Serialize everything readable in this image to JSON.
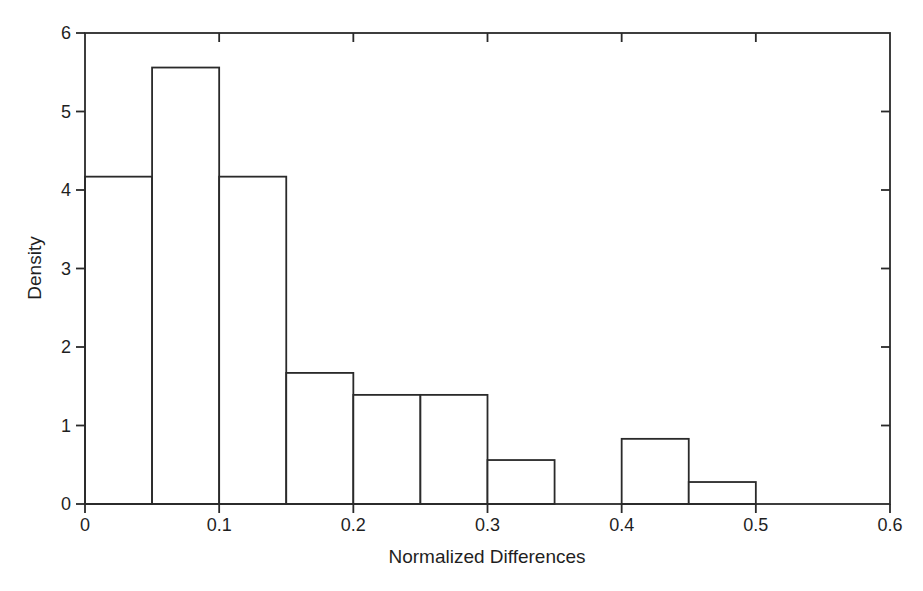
{
  "figure": {
    "background": "#ffffff",
    "line_color": "#2a2a2a",
    "text_color": "#1f1f1f",
    "bar_fill": "#ffffff"
  },
  "chart_data": {
    "type": "bar",
    "subtype": "histogram",
    "title": "",
    "xlabel": "Normalized Differences",
    "ylabel": "Density",
    "xlim": [
      0,
      0.6
    ],
    "ylim": [
      0,
      6
    ],
    "grid": false,
    "legend": false,
    "frame": "full-box",
    "bin_width": 0.05,
    "bins": [
      {
        "from": 0.0,
        "to": 0.05,
        "density": 4.17
      },
      {
        "from": 0.05,
        "to": 0.1,
        "density": 5.56
      },
      {
        "from": 0.1,
        "to": 0.15,
        "density": 4.17
      },
      {
        "from": 0.15,
        "to": 0.2,
        "density": 1.67
      },
      {
        "from": 0.2,
        "to": 0.25,
        "density": 1.39
      },
      {
        "from": 0.25,
        "to": 0.3,
        "density": 1.39
      },
      {
        "from": 0.3,
        "to": 0.35,
        "density": 0.56
      },
      {
        "from": 0.35,
        "to": 0.4,
        "density": 0.0
      },
      {
        "from": 0.4,
        "to": 0.45,
        "density": 0.83
      },
      {
        "from": 0.45,
        "to": 0.5,
        "density": 0.28
      }
    ],
    "x_ticks": {
      "values": [
        0,
        0.1,
        0.2,
        0.3,
        0.4,
        0.5,
        0.6
      ],
      "labels": [
        "0",
        "0.1",
        "0.2",
        "0.3",
        "0.4",
        "0.5",
        "0.6"
      ]
    },
    "y_ticks": {
      "values": [
        0,
        1,
        2,
        3,
        4,
        5,
        6
      ],
      "labels": [
        "0",
        "1",
        "2",
        "3",
        "4",
        "5",
        "6"
      ]
    }
  }
}
